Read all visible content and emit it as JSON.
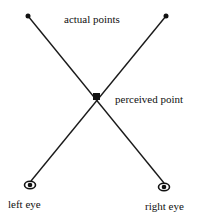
{
  "diagram": {
    "labels": {
      "actual_points": "actual points",
      "perceived_point": "perceived point",
      "left_eye": "left eye",
      "right_eye": "right eye"
    },
    "icons": {
      "eye": "eye-icon",
      "point": "dot"
    },
    "colors": {
      "line": "#1a1a1a",
      "background": "#ffffff"
    }
  }
}
